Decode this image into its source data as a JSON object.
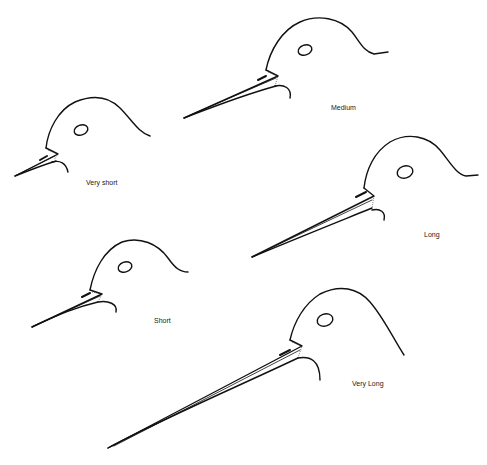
{
  "figure": {
    "background": "#ffffff",
    "stroke_color": "#111111",
    "heads": [
      {
        "id": "very-short",
        "label": "Very short",
        "label_pos": [
          86,
          179
        ],
        "crown": "M46,148 C48,130 58,110 75,102 C92,95 108,96 120,108 C132,120 138,132 150,136",
        "eye": [
          81,
          130,
          7,
          5
        ],
        "beak_upper": "M46,148 L58,154 L15,176",
        "beak_lower": "M15,176 C25,172 40,166 56,161",
        "beak_mid": "M17,175 L55,156",
        "nostril": "M40,160 L47,156",
        "chin": "M52,162 C60,160 66,163 68,172",
        "gape": "M48,150 L58,154 L54,160"
      },
      {
        "id": "medium",
        "label": "Medium",
        "label_pos": [
          331,
          104
        ],
        "crown": "M266,70 C270,50 282,30 300,22 C318,14 340,18 352,32 C360,42 364,52 374,54 L388,52",
        "eye": [
          305,
          50,
          7,
          5
        ],
        "beak_upper": "M266,70 L278,76 L184,118",
        "beak_lower": "M184,118 C210,108 240,96 276,86",
        "beak_mid": "M188,116 L276,78",
        "nostril": "M258,80 L266,76",
        "chin": "M275,86 C284,84 292,88 290,98",
        "gape": "M268,72 L278,76 L275,86"
      },
      {
        "id": "long",
        "label": "Long",
        "label_pos": [
          424,
          231
        ],
        "crown": "M364,188 C366,170 374,152 390,142 C408,132 428,136 440,150 C450,162 456,174 466,176 L478,175",
        "eye": [
          405,
          172,
          8,
          6
        ],
        "beak_upper": "M364,188 L374,196 L252,257",
        "beak_lower": "M252,257 C285,243 330,225 372,208",
        "beak_mid": "M256,255 L372,200",
        "nostril": "M356,197 L366,192",
        "chin": "M372,210 C380,208 386,212 384,220",
        "gape": "M366,190 L374,196 L372,208"
      },
      {
        "id": "short",
        "label": "Short",
        "label_pos": [
          154,
          317
        ],
        "crown": "M90,290 C94,270 104,250 122,242 C140,236 158,244 168,258 C175,268 180,272 188,272",
        "eye": [
          125,
          267,
          7,
          5
        ],
        "beak_upper": "M90,290 L102,294 L32,327",
        "beak_lower": "M32,327 C52,318 72,308 98,302",
        "beak_mid": "M36,325 L100,296",
        "nostril": "M82,297 L90,293",
        "chin": "M98,302 C108,300 118,304 116,312",
        "gape": "M92,292 L102,294 L98,302"
      },
      {
        "id": "very-long",
        "label": "Very Long",
        "label_pos": [
          352,
          380
        ],
        "crown": "M290,340 C294,322 304,304 320,294 C340,284 358,288 370,302 C384,318 394,340 404,355",
        "eye": [
          325,
          320,
          8,
          6
        ],
        "beak_upper": "M290,340 L302,346 L108,448",
        "beak_lower": "M108,448 C160,420 230,390 298,358",
        "beak_mid": "M114,446 L300,350",
        "nostril": "M280,355 L290,350",
        "chin": "M298,358 C310,356 320,360 320,380",
        "gape": "M292,342 L302,346 L298,358"
      }
    ]
  }
}
